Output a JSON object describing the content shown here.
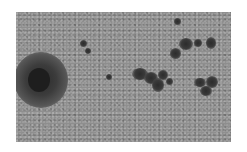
{
  "image": {
    "subject": "solar photosphere granulation with sunspots",
    "description": "Grayscale telescope image showing granulated solar surface, a large sunspot with penumbra on the left, and several smaller sunspot groups in the center and right",
    "colors": {
      "background": "#ffffff",
      "granulation": "#8e8e8e",
      "umbra": "#1e1e1e"
    },
    "features": [
      {
        "name": "large-sunspot",
        "x": 40,
        "y": 80,
        "r": 26
      },
      {
        "name": "central-sunspot-group",
        "x": 148,
        "y": 78
      },
      {
        "name": "upper-right-sunspot-group",
        "x": 190,
        "y": 45
      },
      {
        "name": "right-sunspot-group",
        "x": 205,
        "y": 85
      },
      {
        "name": "small-pores-upper-left",
        "x": 85,
        "y": 45
      }
    ]
  }
}
